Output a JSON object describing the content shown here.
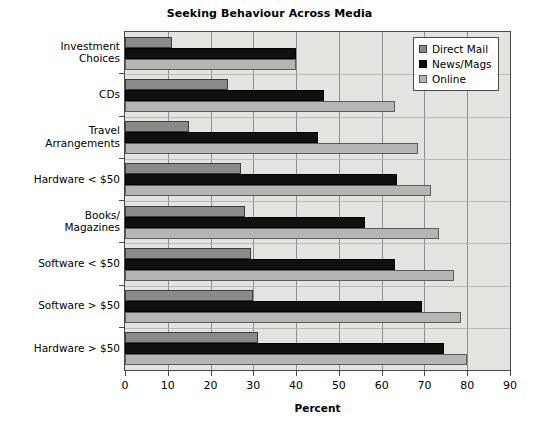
{
  "chart_data": {
    "type": "bar",
    "orientation": "horizontal",
    "title": "Seeking Behaviour Across Media",
    "xlabel": "Percent",
    "ylabel": "",
    "xlim": [
      0,
      90
    ],
    "xticks": [
      0,
      10,
      20,
      30,
      40,
      50,
      60,
      70,
      80,
      90
    ],
    "grid": true,
    "legend_position": "top-right",
    "categories": [
      "Investment\nChoices",
      "CDs",
      "Travel\nArrangements",
      "Hardware < $50",
      "Books/\nMagazines",
      "Software < $50",
      "Software > $50",
      "Hardware > $50"
    ],
    "series": [
      {
        "name": "Direct Mail",
        "color": "#8a8a8a",
        "values": [
          11,
          24,
          15,
          27,
          28,
          29.5,
          30,
          31
        ]
      },
      {
        "name": "News/Mags",
        "color": "#101010",
        "values": [
          40,
          46.5,
          45,
          63.5,
          56,
          63,
          69.5,
          74.5
        ]
      },
      {
        "name": "Online",
        "color": "#b5b5b5",
        "values": [
          40,
          63,
          68.5,
          71.5,
          73.5,
          77,
          78.5,
          80
        ]
      }
    ]
  },
  "legend": {
    "items": [
      {
        "label": "Direct Mail"
      },
      {
        "label": "News/Mags"
      },
      {
        "label": "Online"
      }
    ]
  },
  "colors": {
    "plot_background": "#e3e3e0",
    "axis": "#4a4a4a",
    "gridline": "#8d8d8d",
    "direct_mail": "#8a8a8a",
    "news_mags": "#101010",
    "online": "#b5b5b5"
  }
}
